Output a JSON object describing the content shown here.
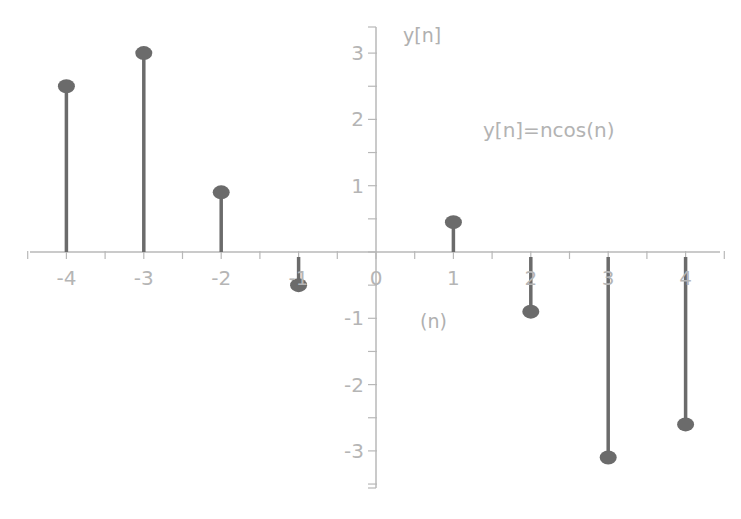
{
  "chart_data": {
    "type": "stem",
    "title": "y[n]=ncos(n)",
    "xlabel": "(n)",
    "ylabel": "y[n]",
    "x": [
      -4,
      -3,
      -2,
      -1,
      1,
      2,
      3,
      4
    ],
    "values": [
      2.5,
      3.0,
      0.9,
      -0.5,
      0.45,
      -0.9,
      -3.1,
      -2.6
    ],
    "series": [
      {
        "name": "y[n]",
        "x": [
          -4,
          -3,
          -2,
          -1,
          1,
          2,
          3,
          4
        ],
        "values": [
          2.5,
          3.0,
          0.9,
          -0.5,
          0.45,
          -0.9,
          -3.1,
          -2.6
        ]
      }
    ],
    "x_ticks": [
      "-4",
      "-3",
      "-2",
      "-1",
      "0",
      "1",
      "2",
      "3",
      "4"
    ],
    "y_ticks": [
      "3",
      "2",
      "1",
      "-1",
      "-2",
      "-3"
    ],
    "xlim": [
      -4.5,
      4.5
    ],
    "ylim": [
      -3.6,
      3.4
    ],
    "grid": false,
    "legend": "none"
  },
  "colors": {
    "stem": "#6b6b6b",
    "axis": "#b8b8b8",
    "text": "#b3b3b3"
  }
}
